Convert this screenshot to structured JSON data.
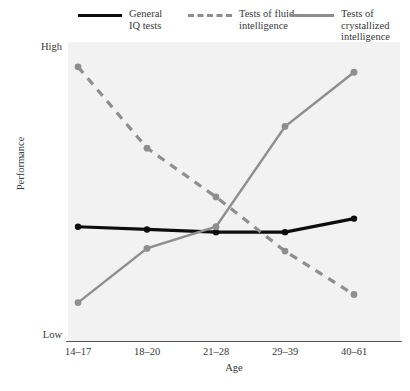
{
  "legend": {
    "items": [
      {
        "label": "General\nIQ tests",
        "style": "solid-black",
        "color": "#0d0d0d"
      },
      {
        "label": "Tests of fluid\nintelligence",
        "style": "dashed-gray",
        "color": "#8e8e8e"
      },
      {
        "label": "Tests of crystallized\nintelligence",
        "style": "solid-gray",
        "color": "#8e8e8e"
      }
    ]
  },
  "axes": {
    "ylabel": "Performance",
    "ytick_high": "High",
    "ytick_low": "Low",
    "xlabel": "Age"
  },
  "chart_data": {
    "type": "line",
    "title": "",
    "xlabel": "Age",
    "ylabel": "Performance",
    "categories": [
      "14–17",
      "18–20",
      "21–28",
      "29–39",
      "40–61"
    ],
    "ylim": [
      0,
      100
    ],
    "ytick_labels": [
      "Low",
      "High"
    ],
    "grid": false,
    "legend_position": "top",
    "series": [
      {
        "name": "General IQ tests",
        "color": "#0d0d0d",
        "line_style": "solid",
        "marker": "circle",
        "values": [
          37,
          36,
          35,
          35,
          40
        ]
      },
      {
        "name": "Tests of fluid intelligence",
        "color": "#8e8e8e",
        "line_style": "dashed",
        "marker": "circle",
        "values": [
          96,
          66,
          48,
          28,
          12
        ]
      },
      {
        "name": "Tests of crystallized intelligence",
        "color": "#8e8e8e",
        "line_style": "solid",
        "marker": "circle",
        "values": [
          9,
          29,
          37,
          74,
          94
        ]
      }
    ]
  }
}
